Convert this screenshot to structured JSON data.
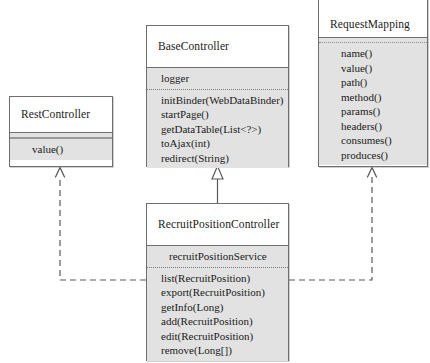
{
  "diagram": {
    "type": "uml-class-diagram",
    "canvas": {
      "width": 430,
      "height": 363
    },
    "colors": {
      "box_fill": "#ffffff",
      "compartment_fill": "#e2e2e2",
      "border": "#6e6e6e",
      "text": "#1a1a1a",
      "connector": "#4a4a4a"
    },
    "classes": [
      {
        "id": "RestController",
        "name": "RestController",
        "stereotype": "",
        "attributes": [],
        "methods": [
          "value()"
        ]
      },
      {
        "id": "BaseController",
        "name": "BaseController",
        "stereotype": "",
        "attributes": [
          "logger"
        ],
        "methods": [
          "initBinder(WebDataBinder)",
          "startPage()",
          "getDataTable(List<?>)",
          "toAjax(int)",
          "redirect(String)"
        ]
      },
      {
        "id": "RequestMapping",
        "name": "RequestMapping",
        "stereotype": "",
        "attributes": [],
        "methods": [
          "name()",
          "value()",
          "path()",
          "method()",
          "params()",
          "headers()",
          "consumes()",
          "produces()"
        ]
      },
      {
        "id": "RecruitPositionController",
        "name": "RecruitPositionController",
        "stereotype": "",
        "attributes": [
          "recruitPositionService"
        ],
        "methods": [
          "list(RecruitPosition)",
          "export(RecruitPosition)",
          "getInfo(Long)",
          "add(RecruitPosition)",
          "edit(RecruitPosition)",
          "remove(Long[])"
        ]
      }
    ],
    "relationships": [
      {
        "id": "rel-generalization",
        "kind": "generalization",
        "style": "solid",
        "arrow": "hollow-triangle",
        "from": "RecruitPositionController",
        "to": "BaseController",
        "label": ""
      },
      {
        "id": "rel-dependency-rest",
        "kind": "dependency",
        "style": "dashed",
        "arrow": "open-arrow",
        "from": "RecruitPositionController",
        "to": "RestController",
        "label": ""
      },
      {
        "id": "rel-dependency-requestmapping",
        "kind": "dependency",
        "style": "dashed",
        "arrow": "open-arrow",
        "from": "RecruitPositionController",
        "to": "RequestMapping",
        "label": ""
      }
    ]
  }
}
